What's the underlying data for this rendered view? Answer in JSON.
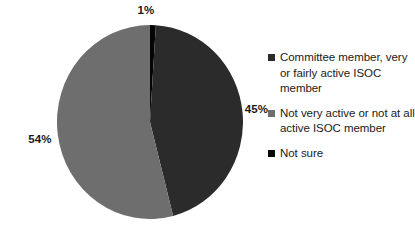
{
  "chart_data": {
    "type": "pie",
    "title": "",
    "categories": [
      "Committee member, very or fairly active ISOC member",
      "Not very active or not at all active ISOC member",
      "Not sure"
    ],
    "values": [
      45,
      54,
      1
    ],
    "value_labels": [
      "45%",
      "54%",
      "1%"
    ],
    "colors": [
      "#2b2b2b",
      "#6e6e6e",
      "#050505"
    ],
    "start_angle_deg": 0,
    "direction": "clockwise",
    "legend_position": "right",
    "grid": false,
    "xlabel": "",
    "ylabel": ""
  },
  "labels": {
    "not_sure_pct": "1%",
    "not_active_pct": "54%",
    "committee_pct": "45%"
  },
  "legend": {
    "items": [
      {
        "label": "Committee member, very or fairly active ISOC member",
        "color": "#2b2b2b"
      },
      {
        "label": "Not very active or not at all active ISOC member",
        "color": "#6e6e6e"
      },
      {
        "label": "Not sure",
        "color": "#050505"
      }
    ]
  },
  "colors": {
    "background": "#ffffff",
    "text": "#1a1a1a",
    "slice_committee": "#2b2b2b",
    "slice_not_active": "#6e6e6e",
    "slice_not_sure": "#050505"
  }
}
